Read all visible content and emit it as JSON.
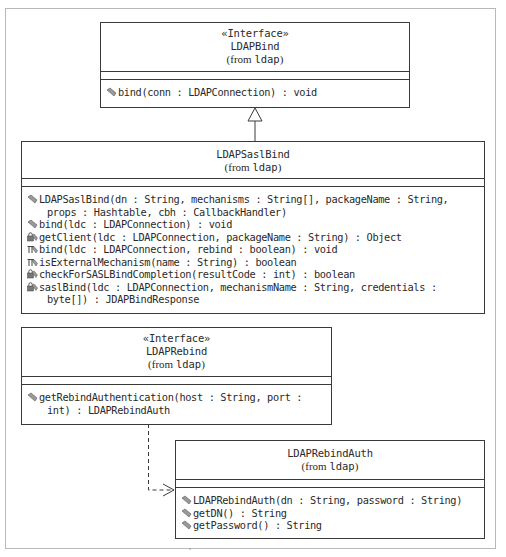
{
  "diagram": {
    "type": "UML class diagram",
    "classes": [
      {
        "id": "ldapbind",
        "stereotype": "«Interface»",
        "name": "LDAPBind",
        "from_prefix": "(from ",
        "package": "ldap",
        "from_suffix": ")",
        "operations": [
          {
            "visibility": "public",
            "icon": "public-method-icon",
            "lines": [
              "bind(conn : LDAPConnection) : void"
            ]
          }
        ]
      },
      {
        "id": "ldapsaslbind",
        "name": "LDAPSaslBind",
        "from_prefix": "(from ",
        "package": "ldap",
        "from_suffix": ")",
        "operations": [
          {
            "visibility": "public",
            "icon": "public-method-icon",
            "lines": [
              "LDAPSaslBind(dn : String, mechanisms : String[], packageName : String,",
              "props : Hashtable, cbh : CallbackHandler)"
            ]
          },
          {
            "visibility": "public",
            "icon": "public-method-icon",
            "lines": [
              "bind(ldc : LDAPConnection) : void"
            ]
          },
          {
            "visibility": "private",
            "icon": "private-method-icon",
            "lines": [
              "getClient(ldc : LDAPConnection, packageName : String) : Object"
            ]
          },
          {
            "visibility": "protected",
            "icon": "protected-method-icon",
            "lines": [
              "bind(ldc : LDAPConnection, rebind : boolean) : void"
            ]
          },
          {
            "visibility": "protected",
            "icon": "protected-method-icon",
            "lines": [
              "isExternalMechanism(name : String) : boolean"
            ]
          },
          {
            "visibility": "private",
            "icon": "private-method-icon",
            "lines": [
              "checkForSASLBindCompletion(resultCode : int) : boolean"
            ]
          },
          {
            "visibility": "private",
            "icon": "private-method-icon",
            "lines": [
              "saslBind(ldc : LDAPConnection, mechanismName : String, credentials :",
              "byte[]) : JDAPBindResponse"
            ]
          }
        ]
      },
      {
        "id": "ldaprebind",
        "stereotype": "«Interface»",
        "name": "LDAPRebind",
        "from_prefix": "(from ",
        "package": "ldap",
        "from_suffix": ")",
        "operations": [
          {
            "visibility": "public",
            "icon": "public-method-icon",
            "lines": [
              "getRebindAuthentication(host : String, port :",
              "int) : LDAPRebindAuth"
            ]
          }
        ]
      },
      {
        "id": "ldaprebindauth",
        "name": "LDAPRebindAuth",
        "from_prefix": "(from ",
        "package": "ldap",
        "from_suffix": ")",
        "operations": [
          {
            "visibility": "public",
            "icon": "public-method-icon",
            "lines": [
              "LDAPRebindAuth(dn : String, password : String)"
            ]
          },
          {
            "visibility": "public",
            "icon": "public-method-icon",
            "lines": [
              "getDN() : String"
            ]
          },
          {
            "visibility": "public",
            "icon": "public-method-icon",
            "lines": [
              "getPassword() : String"
            ]
          }
        ]
      }
    ],
    "relationships": [
      {
        "type": "generalization",
        "from": "LDAPSaslBind",
        "to": "LDAPBind"
      },
      {
        "type": "dependency",
        "from": "LDAPRebind",
        "to": "LDAPRebindAuth"
      }
    ],
    "colors": {
      "line": "#3a3a3a",
      "frame": "#b8b8b8",
      "text": "#2a2a2a",
      "icon": "#7a7a7a"
    }
  }
}
